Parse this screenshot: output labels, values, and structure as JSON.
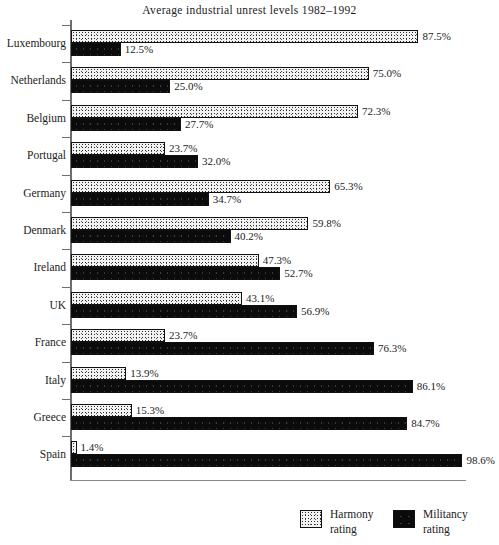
{
  "chart_data": {
    "type": "bar",
    "orientation": "horizontal",
    "stacked": false,
    "title": "Average industrial unrest levels 1982–1992",
    "xlabel": "",
    "ylabel": "",
    "xlim": [
      0,
      100
    ],
    "grid": false,
    "legend_position": "bottom-right",
    "categories": [
      "Luxembourg",
      "Netherlands",
      "Belgium",
      "Portugal",
      "Germany",
      "Denmark",
      "Ireland",
      "UK",
      "France",
      "Italy",
      "Greece",
      "Spain"
    ],
    "series": [
      {
        "name": "Harmony rating",
        "color": "#f2f2f2",
        "values": [
          87.5,
          75.0,
          72.3,
          23.7,
          65.3,
          59.8,
          47.3,
          43.1,
          23.7,
          13.9,
          15.3,
          1.4
        ],
        "labels": [
          "87.5%",
          "75.0%",
          "72.3%",
          "23.7%",
          "65.3%",
          "59.8%",
          "47.3%",
          "43.1%",
          "23.7%",
          "13.9%",
          "15.3%",
          "1.4%"
        ]
      },
      {
        "name": "Militancy rating",
        "color": "#0b0b0b",
        "values": [
          12.5,
          25.0,
          27.7,
          32.0,
          34.7,
          40.2,
          52.7,
          56.9,
          76.3,
          86.1,
          84.7,
          98.6
        ],
        "labels": [
          "12.5%",
          "25.0%",
          "27.7%",
          "32.0%",
          "34.7%",
          "40.2%",
          "52.7%",
          "56.9%",
          "76.3%",
          "86.1%",
          "84.7%",
          "98.6%"
        ]
      }
    ]
  },
  "legend": {
    "items": [
      {
        "name": "Harmony",
        "line1": "Harmony",
        "line2": "rating",
        "swatch": "harmony"
      },
      {
        "name": "Militancy",
        "line1": "Militancy",
        "line2": "rating",
        "swatch": "militancy"
      }
    ]
  }
}
